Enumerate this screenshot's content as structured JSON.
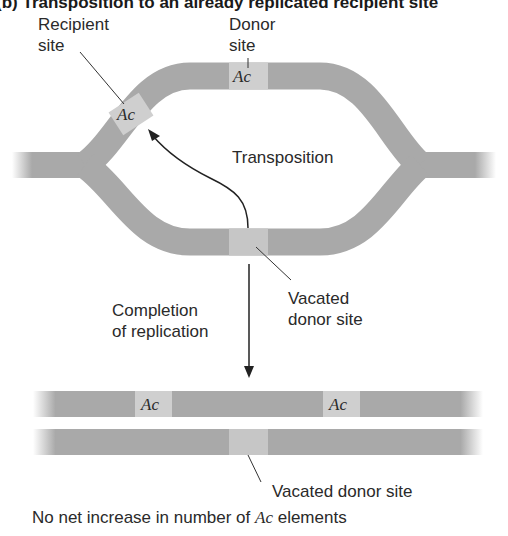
{
  "title": "(b) Transposition to an already replicated recipient site",
  "labels": {
    "recipient_site": [
      "Recipient",
      "site"
    ],
    "donor_site": [
      "Donor",
      "site"
    ],
    "transposition": "Transposition",
    "vacated_donor_site_top": [
      "Vacated",
      "donor site"
    ],
    "completion": [
      "Completion",
      "of replication"
    ],
    "vacated_donor_site_bottom": "Vacated donor site",
    "conclusion_prefix": "No net increase in number of ",
    "conclusion_ac": "Ac",
    "conclusion_suffix": " elements"
  },
  "elements": {
    "ac_label": "Ac",
    "donor_ac": "Ac",
    "recipient_ac": "Ac",
    "final_ac_left": "Ac",
    "final_ac_right": "Ac"
  },
  "colors": {
    "dna_strand": "#a9a9a9",
    "element_box": "#cfcfcf",
    "vacated_box": "#c4c4c4",
    "line": "#333333",
    "text": "#222222"
  }
}
